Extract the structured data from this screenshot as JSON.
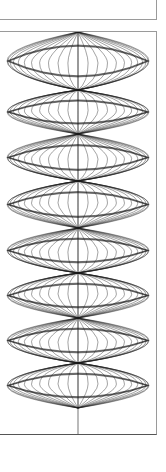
{
  "figure": {
    "stroke_color": "#1a1a1a",
    "frame_border_color": "#9a9a9a",
    "center_x": 78,
    "half_width": 71,
    "nodes_y": [
      58,
      102,
      149,
      196,
      241,
      286,
      331,
      376
    ],
    "top_partial_lobe_y": 0,
    "meridians": 22,
    "lobe_ring_count": 3
  }
}
